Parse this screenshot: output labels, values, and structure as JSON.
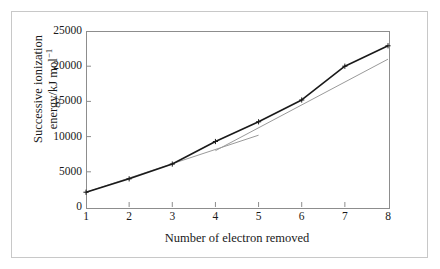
{
  "figure": {
    "background_color": "#ffffff",
    "frame_color": "#c8c8c8",
    "axis_color": "#8d8d8d"
  },
  "chart_data": {
    "type": "line",
    "title": "",
    "subtitle": "",
    "xlabel": "Number of electron removed",
    "ylabel_line1": "Successive ionization",
    "ylabel_line2_prefix": "energy/kJ mol",
    "ylabel_line2_exponent": "−1",
    "ylabel": "Successive ionization energy/kJ mol−1",
    "x": [
      1,
      2,
      3,
      4,
      5,
      6,
      7,
      8
    ],
    "xticklabels": [
      "1",
      "2",
      "3",
      "4",
      "5",
      "6",
      "7",
      "8"
    ],
    "yticks": [
      0,
      5000,
      10000,
      15000,
      20000,
      25000
    ],
    "yticklabels": [
      "0",
      "5000",
      "10000",
      "15000",
      "20000",
      "25000"
    ],
    "xlim": [
      1,
      8
    ],
    "ylim": [
      0,
      25000
    ],
    "grid": false,
    "legend": false,
    "legend_position": "none",
    "series": [
      {
        "name": "Successive ionization energy",
        "color": "#1a1a1a",
        "marker": "cross",
        "linewidth": 1.6,
        "values": [
          2100,
          4000,
          6100,
          9300,
          12100,
          15200,
          20000,
          22900
        ]
      }
    ],
    "annotations": [
      {
        "name": "trend-line-lower",
        "type": "straight-guide-line",
        "color": "#9a9a9a",
        "x_start": 1,
        "y_start": 2100,
        "x_end": 5,
        "y_end": 10200
      },
      {
        "name": "trend-line-upper",
        "type": "straight-guide-line",
        "color": "#9a9a9a",
        "x_start": 4,
        "y_start": 8000,
        "x_end": 8,
        "y_end": 21000
      }
    ]
  }
}
